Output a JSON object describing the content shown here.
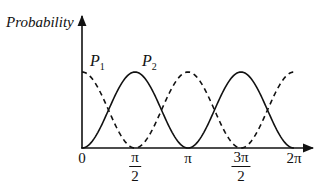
{
  "chart_data": {
    "type": "line",
    "title": "",
    "xlabel": "",
    "ylabel": "Probability",
    "x_ticks": [
      {
        "value": 0,
        "label": "0"
      },
      {
        "value": 1.5708,
        "label": "π/2",
        "num": "π",
        "den": "2"
      },
      {
        "value": 3.1416,
        "label": "π"
      },
      {
        "value": 4.7124,
        "label": "3π/2",
        "num": "3π",
        "den": "2"
      },
      {
        "value": 6.2832,
        "label": "2π"
      }
    ],
    "xlim": [
      0,
      6.2832
    ],
    "ylim": [
      0,
      1
    ],
    "grid": false,
    "series": [
      {
        "name": "P1",
        "label_main": "P",
        "label_sub": "1",
        "style": "dashed",
        "function": "cos^2(x)",
        "x": [
          0,
          0.7854,
          1.5708,
          2.3562,
          3.1416,
          3.927,
          4.7124,
          5.4978,
          6.2832
        ],
        "values": [
          1,
          0.5,
          0,
          0.5,
          1,
          0.5,
          0,
          0.5,
          1
        ]
      },
      {
        "name": "P2",
        "label_main": "P",
        "label_sub": "2",
        "style": "solid",
        "function": "sin^2(x)",
        "x": [
          0,
          0.7854,
          1.5708,
          2.3562,
          3.1416,
          3.927,
          4.7124,
          5.4978,
          6.2832
        ],
        "values": [
          0,
          0.5,
          1,
          0.5,
          0,
          0.5,
          1,
          0.5,
          0
        ]
      }
    ]
  },
  "axis": {
    "ylabel": "Probability"
  },
  "ticks": {
    "t0": "0",
    "t1_num": "π",
    "t1_den": "2",
    "t2": "π",
    "t3_num": "3π",
    "t3_den": "2",
    "t4": "2π"
  },
  "legend": {
    "p1_main": "P",
    "p1_sub": "1",
    "p2_main": "P",
    "p2_sub": "2"
  }
}
